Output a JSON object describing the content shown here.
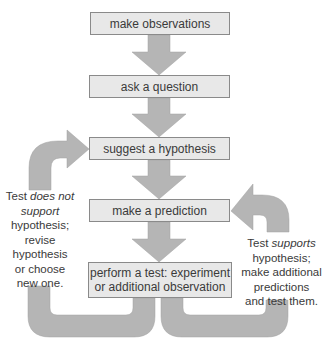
{
  "diagram": {
    "type": "flowchart",
    "title": "",
    "colors": {
      "box_fill": "#e8e8e8",
      "box_border": "#8a8a8a",
      "arrow_fill": "#b5b5b5",
      "text": "#3a3a3a"
    },
    "steps": [
      {
        "id": "observe",
        "label": "make observations"
      },
      {
        "id": "question",
        "label": "ask a question"
      },
      {
        "id": "hypothesis",
        "label": "suggest a hypothesis"
      },
      {
        "id": "prediction",
        "label": "make a prediction"
      },
      {
        "id": "test",
        "label_line1": "perform a test: experiment",
        "label_line2": "or additional observation"
      }
    ],
    "feedback_left": {
      "line1_prefix": "Test ",
      "line1_em": "does not",
      "line2_em": "support",
      "line3": "hypothesis;",
      "line4": "revise",
      "line5": "hypothesis",
      "line6": "or choose",
      "line7": "new one.",
      "target": "suggest a hypothesis"
    },
    "feedback_right": {
      "line1_prefix": "Test ",
      "line1_em": "supports",
      "line2": "hypothesis;",
      "line3": "make additional",
      "line4": "predictions",
      "line5": "and test them.",
      "target": "make a prediction"
    }
  }
}
